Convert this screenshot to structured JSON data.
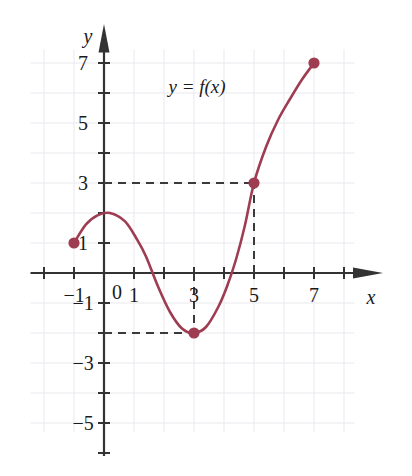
{
  "figure": {
    "kind": "cartesian-function-graph",
    "background_color": "#ffffff",
    "curve_color": "#9e3d52",
    "axis_color": "#333333",
    "grid_color": "#e9e9ef",
    "dash_color": "#3a3a3a"
  },
  "axes": {
    "x_name": "x",
    "y_name": "y",
    "origin_label": "0",
    "x_ticks_labeled": [
      {
        "value": -1,
        "label": "−1"
      },
      {
        "value": 1,
        "label": "1"
      },
      {
        "value": 3,
        "label": "3"
      },
      {
        "value": 5,
        "label": "5"
      },
      {
        "value": 7,
        "label": "7"
      }
    ],
    "y_ticks_labeled": [
      {
        "value": 7,
        "label": "7"
      },
      {
        "value": 5,
        "label": "5"
      },
      {
        "value": 3,
        "label": "3"
      },
      {
        "value": 1,
        "label": "1"
      },
      {
        "value": -1,
        "label": "−1"
      },
      {
        "value": -3,
        "label": "−3"
      },
      {
        "value": -5,
        "label": "−5"
      }
    ]
  },
  "annotations": {
    "function_label": "y = f(x)"
  },
  "chart_data": {
    "type": "line",
    "title": "",
    "subtitle": "",
    "xlabel": "x",
    "ylabel": "y",
    "xlim": [
      -2,
      8
    ],
    "ylim": [
      -6,
      8
    ],
    "grid": true,
    "grid_step": 1,
    "tick_step": 1,
    "labeled_tick_step": 2,
    "legend": "none",
    "series": [
      {
        "name": "y = f(x)",
        "color": "#9e3d52",
        "x": [
          -1.0,
          -0.6,
          -0.2,
          0.2,
          0.7,
          1.1,
          1.4,
          1.8,
          2.2,
          2.6,
          3.0,
          3.4,
          3.8,
          4.1,
          4.4,
          4.7,
          5.0,
          5.4,
          5.8,
          6.2,
          6.6,
          7.0
        ],
        "y": [
          1.0,
          1.62,
          1.93,
          2.0,
          1.72,
          1.12,
          0.55,
          -0.45,
          -1.3,
          -1.85,
          -2.0,
          -1.8,
          -1.15,
          -0.45,
          0.45,
          1.6,
          3.0,
          4.2,
          5.1,
          5.8,
          6.45,
          7.0
        ]
      }
    ],
    "marked_points": [
      {
        "name": "left-endpoint",
        "x": -1,
        "y": 1,
        "filled": true
      },
      {
        "name": "local-minimum",
        "x": 3,
        "y": -2,
        "filled": true
      },
      {
        "name": "point-5-3",
        "x": 5,
        "y": 3,
        "filled": true
      },
      {
        "name": "right-endpoint",
        "x": 7,
        "y": 7,
        "filled": true
      }
    ],
    "guide_lines": [
      {
        "name": "horizontal-guide-y3",
        "orientation": "horizontal",
        "y": 3,
        "from_x": 0,
        "to_x": 5,
        "style": "dashed"
      },
      {
        "name": "vertical-guide-x5",
        "orientation": "vertical",
        "x": 5,
        "from_y": 0,
        "to_y": 3,
        "style": "dashed"
      },
      {
        "name": "horizontal-guide-yn2",
        "orientation": "horizontal",
        "y": -2,
        "from_x": 0,
        "to_x": 3,
        "style": "dashed"
      },
      {
        "name": "vertical-guide-x3",
        "orientation": "vertical",
        "x": 3,
        "from_y": 0,
        "to_y": -2,
        "style": "dashed"
      }
    ],
    "annotations": [
      {
        "name": "function-label",
        "text": "y = f(x)",
        "x": 3.1,
        "y": 6.2
      }
    ]
  }
}
